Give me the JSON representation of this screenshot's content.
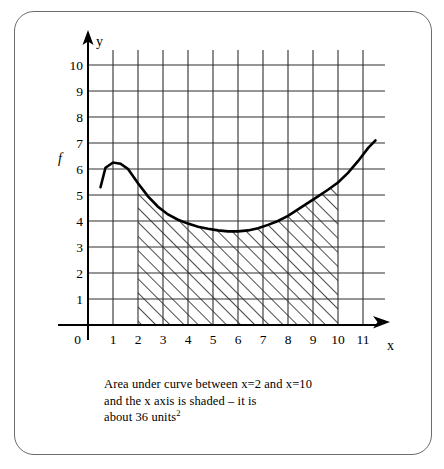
{
  "figure": {
    "axis_labels": {
      "x": "x",
      "y": "y",
      "function": "f"
    },
    "origin_label": "0",
    "x_ticks": [
      "1",
      "2",
      "3",
      "4",
      "5",
      "6",
      "7",
      "8",
      "9",
      "10",
      "11"
    ],
    "y_ticks": [
      "1",
      "2",
      "3",
      "4",
      "5",
      "6",
      "7",
      "8",
      "9",
      "10"
    ],
    "shading": {
      "from_x": 2,
      "to_x": 10,
      "style": "diagonal-hatch"
    },
    "colors": {
      "ink": "#000000",
      "grid": "#3a3a3a",
      "border": "#6b6b6b",
      "background": "#ffffff"
    }
  },
  "caption": {
    "line1": "Area under curve between x=2 and x=10",
    "line2": "and the x axis is shaded – it is",
    "line3_prefix": "about 36 units",
    "line3_exponent": "2"
  },
  "chart_data": {
    "type": "line",
    "title": "",
    "xlabel": "x",
    "ylabel": "y",
    "xlim": [
      0,
      11.6
    ],
    "ylim": [
      0,
      10.6
    ],
    "grid": true,
    "legend": false,
    "xticks": [
      0,
      1,
      2,
      3,
      4,
      5,
      6,
      7,
      8,
      9,
      10,
      11
    ],
    "yticks": [
      0,
      1,
      2,
      3,
      4,
      5,
      6,
      7,
      8,
      9,
      10
    ],
    "series": [
      {
        "name": "f",
        "x": [
          0.5,
          0.7,
          1.0,
          1.3,
          1.6,
          2.0,
          2.4,
          2.8,
          3.2,
          3.6,
          4.0,
          4.4,
          4.8,
          5.2,
          5.6,
          6.0,
          6.4,
          6.8,
          7.2,
          7.6,
          8.0,
          8.4,
          8.8,
          9.2,
          9.6,
          10.0,
          10.4,
          10.8,
          11.2,
          11.5
        ],
        "y": [
          5.3,
          6.05,
          6.25,
          6.2,
          6.0,
          5.45,
          4.95,
          4.55,
          4.25,
          4.05,
          3.9,
          3.78,
          3.7,
          3.64,
          3.6,
          3.6,
          3.64,
          3.72,
          3.85,
          4.0,
          4.2,
          4.45,
          4.7,
          4.95,
          5.2,
          5.48,
          5.85,
          6.3,
          6.8,
          7.1
        ]
      }
    ],
    "annotations": [
      {
        "text": "f",
        "x": 0.0,
        "y": 6.6
      }
    ],
    "shaded_region": {
      "x_start": 2,
      "x_end": 10,
      "bounded_below_by": "x-axis",
      "bounded_above_by": "f",
      "approx_area": 36,
      "area_units": "units^2"
    }
  }
}
